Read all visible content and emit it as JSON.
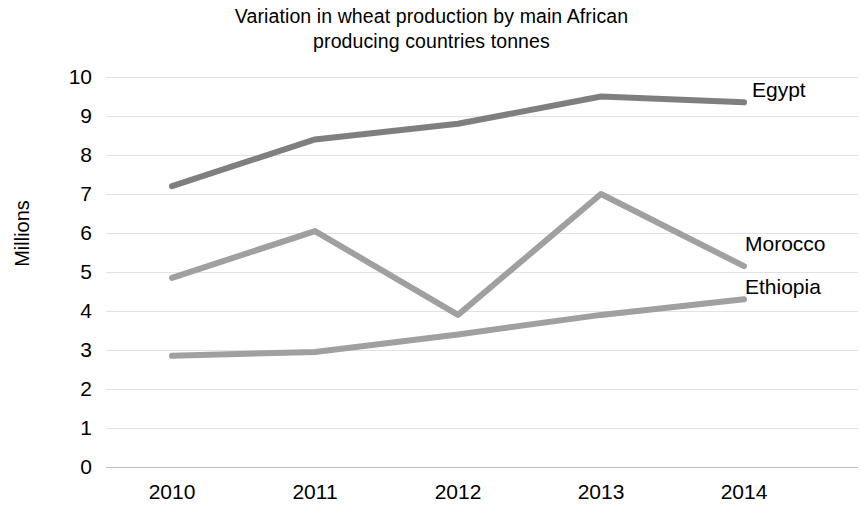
{
  "chart_data": {
    "type": "line",
    "title": "Variation in wheat production by main African producing countries tonnes",
    "title_line1": "Variation in wheat production by main African",
    "title_line2": "producing countries tonnes",
    "xlabel": "",
    "ylabel": "Millions",
    "categories": [
      "2010",
      "2011",
      "2012",
      "2013",
      "2014"
    ],
    "x_tick_labels": [
      "2010",
      "2011",
      "2012",
      "2013",
      "2014"
    ],
    "y_tick_labels": [
      "10",
      "9",
      "8",
      "7",
      "6",
      "5",
      "4",
      "3",
      "2",
      "1",
      "0"
    ],
    "ylim": [
      0,
      10
    ],
    "y_tick_step": 1,
    "grid": true,
    "grid_axis": "y",
    "legend_position": "inline-right-end-labels",
    "series": [
      {
        "name": "Egypt",
        "values": [
          7.2,
          8.4,
          8.8,
          9.5,
          9.35
        ],
        "color": "#7f7f7f",
        "label": "Egypt"
      },
      {
        "name": "Morocco",
        "values": [
          4.85,
          6.05,
          3.9,
          7.0,
          5.15
        ],
        "color": "#a0a0a0",
        "label": "Morocco"
      },
      {
        "name": "Ethiopia",
        "values": [
          2.85,
          2.95,
          3.4,
          3.9,
          4.3
        ],
        "color": "#a0a0a0",
        "label": "Ethiopia"
      }
    ]
  },
  "axis": {
    "y_label": "Millions",
    "ticks_y": {
      "t10": "10",
      "t9": "9",
      "t8": "8",
      "t7": "7",
      "t6": "6",
      "t5": "5",
      "t4": "4",
      "t3": "3",
      "t2": "2",
      "t1": "1",
      "t0": "0"
    },
    "ticks_x": {
      "x0": "2010",
      "x1": "2011",
      "x2": "2012",
      "x3": "2013",
      "x4": "2014"
    }
  },
  "labels": {
    "egypt": "Egypt",
    "morocco": "Morocco",
    "ethiopia": "Ethiopia"
  },
  "colors": {
    "egypt_line": "#7f7f7f",
    "morocco_line": "#a0a0a0",
    "ethiopia_line": "#a0a0a0",
    "gridline": "#e2e2e2",
    "background": "#ffffff"
  }
}
